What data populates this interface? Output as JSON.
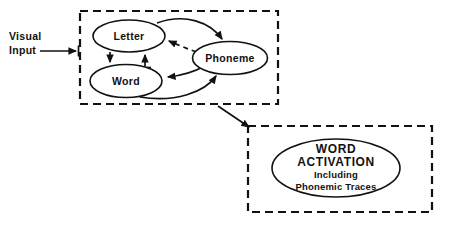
{
  "diagram": {
    "visual_input": {
      "line1": "Visual",
      "line2": "Input"
    },
    "nodes": {
      "letter": "Letter",
      "word": "Word",
      "phoneme": "Phoneme"
    },
    "word_activation": {
      "line1": "WORD",
      "line2": "ACTIVATION",
      "line3": "Including",
      "line4": "Phonemic Traces"
    },
    "colors": {
      "stroke": "#111111",
      "background": "#ffffff"
    },
    "connections": [
      {
        "from": "Letter",
        "to": "Word",
        "style": "solid"
      },
      {
        "from": "Word",
        "to": "Letter",
        "style": "solid"
      },
      {
        "from": "Letter",
        "to": "Phoneme",
        "style": "solid"
      },
      {
        "from": "Phoneme",
        "to": "Letter",
        "style": "dashed"
      },
      {
        "from": "Phoneme",
        "to": "Word",
        "style": "solid"
      },
      {
        "from": "Word",
        "to": "Phoneme",
        "style": "solid"
      },
      {
        "from": "Visual Input",
        "to": "Perception Box",
        "style": "solid"
      },
      {
        "from": "Perception Box",
        "to": "Word Activation Box",
        "style": "solid"
      }
    ]
  }
}
